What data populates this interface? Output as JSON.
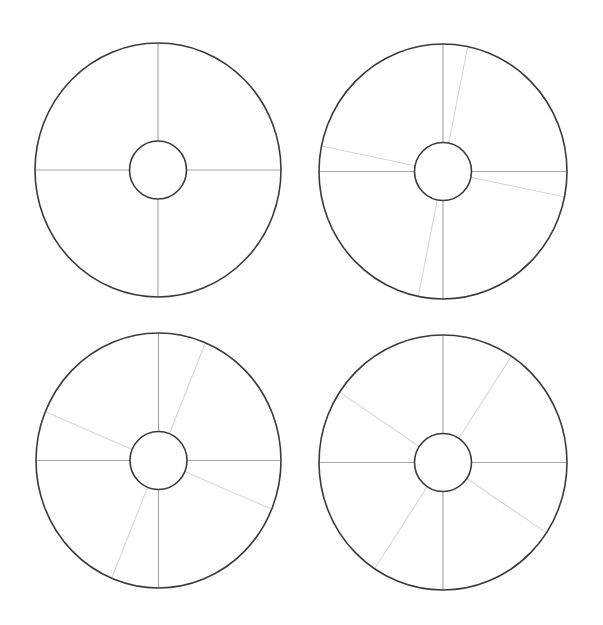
{
  "diagram": {
    "type": "segmented-ring-wheels",
    "count": 4,
    "colors": {
      "background": "#ffffff",
      "ring_stroke": "#3a3a3a",
      "axis_spoke": "#a8a8a8",
      "offset_spoke": "#d6d6d6"
    },
    "wheels": [
      {
        "id": "wheel-top-left",
        "center": [
          158,
          170
        ],
        "outer_radius": [
          123,
          127
        ],
        "inner_radius": [
          28.5,
          29
        ],
        "axis_spokes_deg": [
          0,
          90,
          180,
          270
        ],
        "offset_spokes_deg": []
      },
      {
        "id": "wheel-top-right",
        "center": [
          443,
          171.5
        ],
        "outer_radius": [
          124,
          127.5
        ],
        "inner_radius": [
          28.5,
          29
        ],
        "axis_spokes_deg": [
          0,
          90,
          180,
          270
        ],
        "offset_spokes_deg": [
          11.5,
          101.5,
          191.5,
          281.5
        ]
      },
      {
        "id": "wheel-bottom-left",
        "center": [
          158.5,
          460.5
        ],
        "outer_radius": [
          122.5,
          127.5
        ],
        "inner_radius": [
          28.5,
          29
        ],
        "axis_spokes_deg": [
          0,
          90,
          180,
          270
        ],
        "offset_spokes_deg": [
          22.5,
          112.5,
          202.5,
          292.5
        ]
      },
      {
        "id": "wheel-bottom-right",
        "center": [
          443,
          462.5
        ],
        "outer_radius": [
          124,
          127.5
        ],
        "inner_radius": [
          28.5,
          29
        ],
        "axis_spokes_deg": [
          0,
          90,
          180,
          270
        ],
        "offset_spokes_deg": [
          33.5,
          123.5,
          213.5,
          303.5
        ]
      }
    ]
  }
}
